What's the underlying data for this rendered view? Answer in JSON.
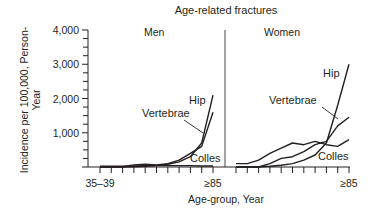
{
  "chart_data": {
    "type": "line",
    "title": "Age-related fractures",
    "xlabel": "Age-group, Year",
    "ylabel": "Incidence per 100,000, Person-Year",
    "ylabel_line1": "Incidence per 100,000, Person-",
    "ylabel_line2": "Year",
    "ylim": [
      0,
      4000
    ],
    "yticks": [
      0,
      1000,
      2000,
      3000,
      4000
    ],
    "ytick_labels": [
      "",
      "1,000",
      "2,000",
      "3,000",
      "4,000"
    ],
    "categories": [
      "35–39",
      "40–44",
      "45–49",
      "50–54",
      "55–59",
      "60–64",
      "65–69",
      "70–74",
      "75–79",
      "80–84",
      "≥85"
    ],
    "xtick_labels_shown": {
      "first": "35–39",
      "last": "≥85"
    },
    "grid": false,
    "panels": [
      {
        "name": "Men",
        "series": [
          {
            "name": "Hip",
            "values": [
              0,
              0,
              0,
              10,
              20,
              40,
              80,
              150,
              300,
              700,
              2100
            ]
          },
          {
            "name": "Vertebrae",
            "values": [
              0,
              0,
              10,
              60,
              80,
              60,
              100,
              200,
              400,
              600,
              1600
            ]
          },
          {
            "name": "Colles",
            "values": [
              20,
              20,
              20,
              30,
              40,
              40,
              40,
              40,
              40,
              30,
              30
            ]
          }
        ]
      },
      {
        "name": "Women",
        "series": [
          {
            "name": "Hip",
            "values": [
              0,
              0,
              0,
              20,
              50,
              100,
              200,
              350,
              700,
              1800,
              3000
            ]
          },
          {
            "name": "Vertebrae",
            "values": [
              0,
              0,
              0,
              100,
              250,
              300,
              450,
              650,
              750,
              1200,
              1450
            ]
          },
          {
            "name": "Colles",
            "values": [
              100,
              100,
              200,
              400,
              550,
              700,
              650,
              750,
              650,
              600,
              800
            ]
          }
        ]
      }
    ],
    "annotations": [
      {
        "panel": "Men",
        "text": "Hip"
      },
      {
        "panel": "Men",
        "text": "Vertebrae"
      },
      {
        "panel": "Men",
        "text": "Colles"
      },
      {
        "panel": "Women",
        "text": "Hip"
      },
      {
        "panel": "Women",
        "text": "Vertebrae"
      },
      {
        "panel": "Women",
        "text": "Colles"
      }
    ],
    "line_color": "#231f20"
  }
}
